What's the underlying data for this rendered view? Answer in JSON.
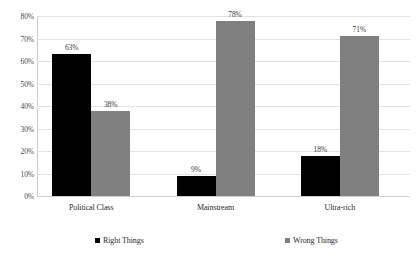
{
  "chart_data": {
    "type": "bar",
    "title": "",
    "subtitle": "",
    "xlabel": "",
    "ylabel": "",
    "categories": [
      "Political Class",
      "Mainstream",
      "Ultra-rich"
    ],
    "series": [
      {
        "name": "Right Things",
        "color": "#000000",
        "values": [
          63,
          9,
          18
        ],
        "labels": [
          "63%",
          "9%",
          "18%"
        ]
      },
      {
        "name": "Wrong Things",
        "color": "#808080",
        "values": [
          38,
          78,
          71
        ],
        "labels": [
          "38%",
          "78%",
          "71%"
        ]
      }
    ],
    "ylim": [
      0,
      80
    ],
    "ytick_values": [
      0,
      10,
      20,
      30,
      40,
      50,
      60,
      70,
      80
    ],
    "ytick_labels": [
      "0%",
      "10%",
      "20%",
      "30%",
      "40%",
      "50%",
      "60%",
      "70%",
      "80%"
    ],
    "grid": true,
    "legend_position": "bottom",
    "value_labels_shown": true,
    "background_color": "#ffffff",
    "gridline_color": "#e2e2e2",
    "axis_color": "#cdcdcd"
  }
}
